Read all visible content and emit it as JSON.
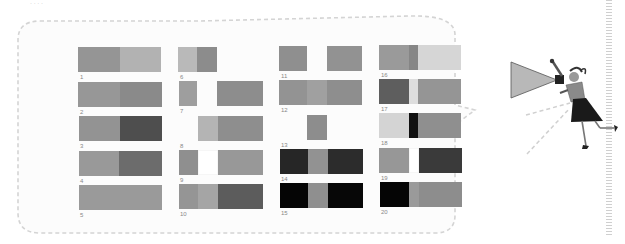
{
  "header": {
    "fragment_text": "· ·  ·  ·"
  },
  "colors": {
    "frame_border": "#d4d4d4",
    "frame_bg": "#fcfcfc",
    "label_color": "#888888"
  },
  "chart_data": {
    "type": "table",
    "title": "",
    "items": [
      {
        "label": "1",
        "segments": [
          {
            "x": 78,
            "w": 42,
            "c": "#959595"
          },
          {
            "x": 120,
            "w": 41,
            "c": "#b2b2b2"
          }
        ],
        "y": 47
      },
      {
        "label": "2",
        "segments": [
          {
            "x": 78,
            "w": 42,
            "c": "#979797"
          },
          {
            "x": 120,
            "w": 42,
            "c": "#8a8a8a"
          }
        ],
        "y": 82
      },
      {
        "label": "3",
        "segments": [
          {
            "x": 79,
            "w": 41,
            "c": "#939393"
          },
          {
            "x": 120,
            "w": 42,
            "c": "#4e4e4e"
          }
        ],
        "y": 116
      },
      {
        "label": "4",
        "segments": [
          {
            "x": 79,
            "w": 40,
            "c": "#999999"
          },
          {
            "x": 119,
            "w": 43,
            "c": "#6c6c6c"
          }
        ],
        "y": 151
      },
      {
        "label": "5",
        "segments": [
          {
            "x": 79,
            "w": 83,
            "c": "#9a9a9a"
          }
        ],
        "y": 185
      },
      {
        "label": "6",
        "segments": [
          {
            "x": 178,
            "w": 19,
            "c": "#b9b9b9"
          },
          {
            "x": 197,
            "w": 20,
            "c": "#8c8c8c"
          }
        ],
        "y": 47
      },
      {
        "label": "7",
        "segments": [
          {
            "x": 179,
            "w": 18,
            "c": "#9e9e9e"
          },
          {
            "x": 217,
            "w": 46,
            "c": "#8d8d8d"
          }
        ],
        "y": 81
      },
      {
        "label": "8",
        "segments": [
          {
            "x": 198,
            "w": 20,
            "c": "#b4b4b4"
          },
          {
            "x": 218,
            "w": 45,
            "c": "#8e8e8e"
          }
        ],
        "y": 116
      },
      {
        "label": "9",
        "segments": [
          {
            "x": 179,
            "w": 19,
            "c": "#8f8f8f"
          },
          {
            "x": 198,
            "w": 20,
            "c": "#ffffff"
          },
          {
            "x": 218,
            "w": 45,
            "c": "#989898"
          }
        ],
        "y": 150
      },
      {
        "label": "10",
        "segments": [
          {
            "x": 179,
            "w": 19,
            "c": "#959595"
          },
          {
            "x": 198,
            "w": 20,
            "c": "#a5a5a5"
          },
          {
            "x": 218,
            "w": 45,
            "c": "#5c5c5c"
          }
        ],
        "y": 184
      },
      {
        "label": "11",
        "segments": [
          {
            "x": 279,
            "w": 28,
            "c": "#8f8f8f"
          },
          {
            "x": 327,
            "w": 35,
            "c": "#929292"
          }
        ],
        "y": 46
      },
      {
        "label": "12",
        "segments": [
          {
            "x": 279,
            "w": 28,
            "c": "#939393"
          },
          {
            "x": 307,
            "w": 20,
            "c": "#a0a0a0"
          },
          {
            "x": 327,
            "w": 35,
            "c": "#8e8e8e"
          }
        ],
        "y": 80
      },
      {
        "label": "13",
        "segments": [
          {
            "x": 307,
            "w": 20,
            "c": "#8d8d8d"
          }
        ],
        "y": 115
      },
      {
        "label": "14",
        "segments": [
          {
            "x": 280,
            "w": 28,
            "c": "#262626"
          },
          {
            "x": 308,
            "w": 20,
            "c": "#929292"
          },
          {
            "x": 328,
            "w": 35,
            "c": "#2c2c2c"
          }
        ],
        "y": 149
      },
      {
        "label": "15",
        "segments": [
          {
            "x": 280,
            "w": 28,
            "c": "#050505"
          },
          {
            "x": 308,
            "w": 20,
            "c": "#8f8f8f"
          },
          {
            "x": 328,
            "w": 35,
            "c": "#070707"
          }
        ],
        "y": 183
      },
      {
        "label": "16",
        "segments": [
          {
            "x": 379,
            "w": 30,
            "c": "#9a9a9a"
          },
          {
            "x": 409,
            "w": 9,
            "c": "#868686"
          },
          {
            "x": 418,
            "w": 43,
            "c": "#d6d6d6"
          }
        ],
        "y": 45
      },
      {
        "label": "17",
        "segments": [
          {
            "x": 379,
            "w": 30,
            "c": "#5e5e5e"
          },
          {
            "x": 409,
            "w": 9,
            "c": "#dedede"
          },
          {
            "x": 418,
            "w": 43,
            "c": "#959595"
          }
        ],
        "y": 79
      },
      {
        "label": "18",
        "segments": [
          {
            "x": 379,
            "w": 30,
            "c": "#d4d4d4"
          },
          {
            "x": 409,
            "w": 9,
            "c": "#111111"
          },
          {
            "x": 418,
            "w": 43,
            "c": "#8f8f8f"
          }
        ],
        "y": 113
      },
      {
        "label": "19",
        "segments": [
          {
            "x": 379,
            "w": 30,
            "c": "#979797"
          },
          {
            "x": 409,
            "w": 10,
            "c": "#ffffff"
          },
          {
            "x": 419,
            "w": 43,
            "c": "#3a3a3a"
          }
        ],
        "y": 148
      },
      {
        "label": "20",
        "segments": [
          {
            "x": 380,
            "w": 29,
            "c": "#050505"
          },
          {
            "x": 409,
            "w": 10,
            "c": "#9a9a9a"
          },
          {
            "x": 419,
            "w": 43,
            "c": "#8d8d8d"
          }
        ],
        "y": 182
      }
    ],
    "segment_height": 25
  },
  "illustration": {
    "subject": "woman shouting through megaphone",
    "megaphone_color": "#b8b8b8",
    "skirt_color": "#1a1a1a",
    "top_color": "#8a8a8a"
  }
}
